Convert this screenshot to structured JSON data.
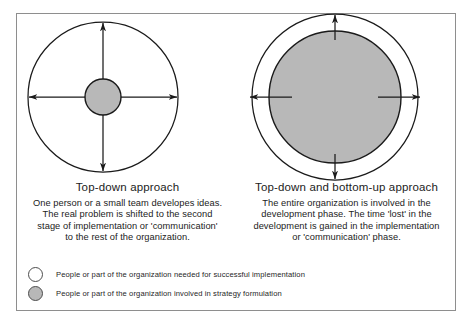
{
  "figure": {
    "border_color": "#8e8e8e",
    "background": "#ffffff"
  },
  "colors": {
    "fill_gray": "#b8b8b8",
    "stroke": "#1a1a1a",
    "frame": "#8e8e8e"
  },
  "diagrams": [
    {
      "id": "top-down",
      "title": "Top-down approach",
      "outer_circle": {
        "cx": 103,
        "cy": 97,
        "r": 75,
        "fill": "none",
        "stroke": "#1a1a1a"
      },
      "inner_circle": {
        "cx": 103,
        "cy": 97,
        "r": 18,
        "fill": "#b8b8b8",
        "stroke": "#1a1a1a"
      },
      "arrows": [
        "up",
        "down",
        "left",
        "right"
      ],
      "arrow_style": "from-center-outward-full-radius",
      "body_lines": [
        "One person or a small team developes ideas.",
        "The real problem is shifted to the second",
        "stage of implementation or 'communication'",
        "to the rest of the organization."
      ]
    },
    {
      "id": "top-down-and-bottom-up",
      "title": "Top-down and bottom-up approach",
      "outer_circle": {
        "cx": 335,
        "cy": 97,
        "r": 83,
        "fill": "none",
        "stroke": "#1a1a1a"
      },
      "inner_circle": {
        "cx": 335,
        "cy": 97,
        "r": 66,
        "fill": "#b8b8b8",
        "stroke": "#1a1a1a"
      },
      "arrows": [
        "up",
        "down",
        "left",
        "right"
      ],
      "arrow_style": "short-stub-across-gap",
      "body_lines": [
        "The entire organization is involved in the",
        "development phase. The time 'lost' in the",
        "development is gained in the implementation",
        "or 'communication' phase."
      ]
    }
  ],
  "legend": {
    "items": [
      {
        "swatch": "open-circle",
        "label": "People or part of the organization needed for successful implementation"
      },
      {
        "swatch": "filled-circle",
        "label": "People or part of the organization involved in strategy formulation"
      }
    ]
  }
}
